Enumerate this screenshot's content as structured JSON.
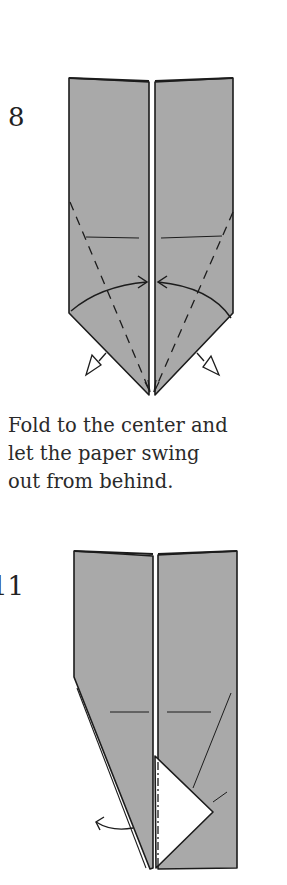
{
  "steps": [
    {
      "number": "8",
      "caption_lines": [
        "Fold to the center and",
        "let the paper swing",
        "out from behind."
      ]
    },
    {
      "number": "11"
    }
  ],
  "colors": {
    "paper": "#a9a9a9",
    "line": "#1c1c1c",
    "background": "#ffffff"
  }
}
